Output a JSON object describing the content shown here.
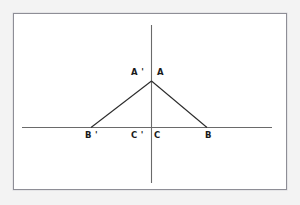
{
  "figure": {
    "type": "geometry-diagram",
    "background_color": "#ffffff",
    "outer_background_color": "#f3f3f3",
    "frame_color": "#8e8e96",
    "line_color": "#2b2b2b",
    "axis_color": "#6a6a6a"
  },
  "axes": {
    "horizontal": {
      "name": "horizontal-axis",
      "x1": 22,
      "y1": 127.5,
      "x2": 272,
      "y2": 127.5
    },
    "vertical": {
      "name": "vertical-axis",
      "x1": 151.5,
      "y1": 25,
      "x2": 151.5,
      "y2": 183
    }
  },
  "shape": {
    "name": "triangle-outline",
    "apex": {
      "x": 151.5,
      "y": 81
    },
    "left_base": {
      "x": 91,
      "y": 127.5
    },
    "right_base": {
      "x": 207,
      "y": 127.5
    }
  },
  "points": [
    {
      "id": "A-prime",
      "label": "A '",
      "x": 131,
      "y": 67
    },
    {
      "id": "A",
      "label": "A",
      "x": 157,
      "y": 67
    },
    {
      "id": "B-prime",
      "label": "B '",
      "x": 85,
      "y": 130
    },
    {
      "id": "C-prime",
      "label": "C '",
      "x": 131,
      "y": 130
    },
    {
      "id": "C",
      "label": "C",
      "x": 154,
      "y": 130
    },
    {
      "id": "B",
      "label": "B",
      "x": 205,
      "y": 130
    }
  ]
}
